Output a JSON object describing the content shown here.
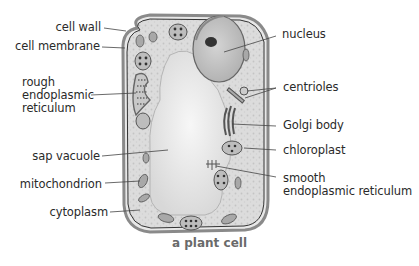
{
  "diagram": {
    "title": "a plant cell",
    "labels_left": [
      {
        "id": "cell-wall",
        "text": "cell wall"
      },
      {
        "id": "cell-membrane",
        "text": "cell membrane"
      },
      {
        "id": "rough-er-1",
        "text": "rough"
      },
      {
        "id": "rough-er-2",
        "text": "endoplasmic"
      },
      {
        "id": "rough-er-3",
        "text": "reticulum"
      },
      {
        "id": "sap-vacuole",
        "text": "sap vacuole"
      },
      {
        "id": "mitochondrion",
        "text": "mitochondrion"
      },
      {
        "id": "cytoplasm",
        "text": "cytoplasm"
      }
    ],
    "labels_right": [
      {
        "id": "nucleus",
        "text": "nucleus"
      },
      {
        "id": "centrioles",
        "text": "centrioles"
      },
      {
        "id": "golgi-body",
        "text": "Golgi body"
      },
      {
        "id": "chloroplast",
        "text": "chloroplast"
      },
      {
        "id": "smooth-er-1",
        "text": "smooth"
      },
      {
        "id": "smooth-er-2",
        "text": "endoplasmic reticulum"
      }
    ],
    "colors": {
      "cytoplasm": "#d9d9d9",
      "vacuole": "#ececec",
      "wall": "#555555",
      "text": "#2a2a2a",
      "caption": "#6a6a6a"
    }
  }
}
